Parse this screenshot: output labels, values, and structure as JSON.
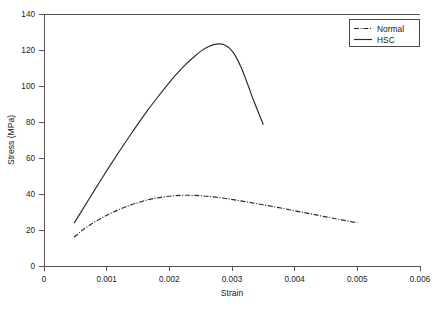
{
  "chart_data": {
    "type": "line",
    "title": "",
    "xlabel": "Strain",
    "ylabel": "Stress (MPa)",
    "xlim": [
      0,
      0.006
    ],
    "ylim": [
      0,
      140
    ],
    "xticks": [
      "0",
      "0.001",
      "0.002",
      "0.003",
      "0.004",
      "0.005",
      "0.006"
    ],
    "xtick_values": [
      0,
      0.001,
      0.002,
      0.003,
      0.004,
      0.005,
      0.006
    ],
    "yticks": [
      "0",
      "20",
      "40",
      "60",
      "80",
      "100",
      "120",
      "140"
    ],
    "ytick_values": [
      0,
      20,
      40,
      60,
      80,
      100,
      120,
      140
    ],
    "grid": false,
    "legend_position": "upper right",
    "series": [
      {
        "name": "Normal",
        "style": "dash-dot",
        "color": "#2b2b2b",
        "x": [
          0.00048,
          0.0006,
          0.00075,
          0.0009,
          0.00105,
          0.0012,
          0.00135,
          0.0015,
          0.00165,
          0.0018,
          0.00195,
          0.0021,
          0.00225,
          0.0024,
          0.00255,
          0.0027,
          0.0029,
          0.0031,
          0.0033,
          0.0035,
          0.00375,
          0.004,
          0.00425,
          0.0045,
          0.00475,
          0.005
        ],
        "y": [
          16.0,
          19.5,
          23.2,
          26.3,
          29.0,
          31.4,
          33.5,
          35.2,
          36.7,
          37.8,
          38.6,
          39.1,
          39.3,
          39.2,
          38.9,
          38.4,
          37.5,
          36.4,
          35.2,
          34.0,
          32.4,
          30.7,
          29.0,
          27.3,
          25.6,
          24.0
        ]
      },
      {
        "name": "HSC",
        "style": "solid",
        "color": "#2b2b2b",
        "x": [
          0.00048,
          0.0006,
          0.00075,
          0.0009,
          0.00105,
          0.0012,
          0.00135,
          0.0015,
          0.00165,
          0.0018,
          0.00195,
          0.0021,
          0.00225,
          0.0024,
          0.00252,
          0.00262,
          0.00272,
          0.0028,
          0.00288,
          0.00296,
          0.00305,
          0.00315,
          0.00325,
          0.00335,
          0.0035
        ],
        "y": [
          23.8,
          30.5,
          39.0,
          47.4,
          55.6,
          63.6,
          71.4,
          79.0,
          86.3,
          93.2,
          99.8,
          106.0,
          111.6,
          116.4,
          119.8,
          121.8,
          123.1,
          123.4,
          122.8,
          121.0,
          117.0,
          110.0,
          101.0,
          91.5,
          78.5
        ]
      }
    ]
  },
  "legend": {
    "items": [
      {
        "label": "Normal",
        "swatch": "dash-dot-swatch"
      },
      {
        "label": "HSC",
        "swatch": "solid-line-swatch"
      }
    ]
  },
  "axes": {
    "x_title": "Strain",
    "y_title": "Stress (MPa)"
  }
}
